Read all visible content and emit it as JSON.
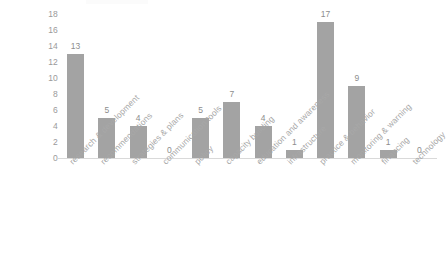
{
  "chart_data": {
    "type": "bar",
    "title": "",
    "subtitle": "",
    "xlabel": "",
    "ylabel": "",
    "categories": [
      "research & development",
      "recommendations",
      "strategies & plans",
      "communication tools",
      "policy",
      "capacity building",
      "education and awareness",
      "infrastructure",
      "practice & behavior",
      "monitoring & warning",
      "financing",
      "technology"
    ],
    "values": [
      13,
      5,
      4,
      0,
      5,
      7,
      4,
      1,
      17,
      9,
      1,
      0
    ],
    "data_labels": [
      "13",
      "5",
      "4",
      "0",
      "5",
      "7",
      "4",
      "1",
      "17",
      "9",
      "1",
      "0"
    ],
    "ylim": [
      0,
      18
    ],
    "ytick_step": 2,
    "ytick_labels": [
      "18",
      "16",
      "14",
      "12",
      "10",
      "8",
      "6",
      "4",
      "2",
      "0"
    ],
    "ytick_values": [
      18,
      16,
      14,
      12,
      10,
      8,
      6,
      4,
      2,
      0
    ],
    "grid": false,
    "legend": null,
    "legend_position": "none",
    "bar_color": "#a3a3a3",
    "axis_color": "#d9d9d9",
    "label_color": "#a8a8a8",
    "value_label_color": "#8d8d8d",
    "tick_label_color": "#9a9a9a",
    "background": "#ffffff"
  }
}
